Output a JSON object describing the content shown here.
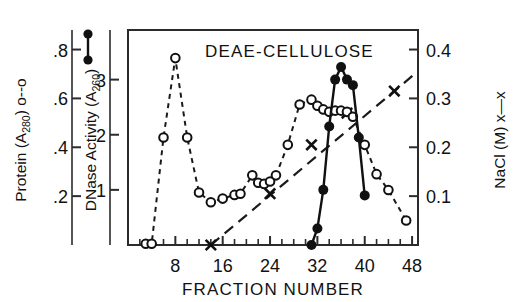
{
  "figure": {
    "title": "DEAE-CELLULOSE",
    "xaxis": {
      "label": "FRACTION NUMBER",
      "ticks": [
        "8",
        "16",
        "24",
        "32",
        "40",
        "48"
      ],
      "range": [
        0,
        49
      ]
    },
    "left_outer_axis": {
      "label_main": "Protein (A",
      "label_sub": "280",
      "label_tail": ") o--o",
      "ticks": [
        ".2",
        ".4",
        ".6",
        ".8"
      ],
      "range": [
        0,
        0.88
      ]
    },
    "left_inner_axis": {
      "label_main": "DNase Activity (A",
      "label_sub": "260",
      "label_tail": ")",
      "ticks": [
        "1",
        "2",
        "3"
      ],
      "range": [
        0,
        3.9
      ]
    },
    "right_axis": {
      "label_main": "NaCl (M) x—x",
      "ticks": [
        "0.1",
        "0.2",
        "0.3",
        "0.4"
      ],
      "range": [
        0,
        0.44
      ]
    },
    "legend": {
      "protein_symbol": "o--o",
      "dnase_symbol": "●—●",
      "nacl_symbol": "x—x"
    }
  },
  "chart_data": {
    "type": "line",
    "title": "DEAE-CELLULOSE",
    "xlabel": "FRACTION NUMBER",
    "ylabel": "Protein (A280) / DNase Activity (A260)",
    "y2label": "NaCl (M)",
    "xlim": [
      0,
      49
    ],
    "ylim": [
      0,
      0.88
    ],
    "y2lim": [
      0,
      0.44
    ],
    "grid": false,
    "legend_position": "left-axis-labels",
    "series": [
      {
        "name": "Protein (A280)",
        "marker": "open-circle",
        "linestyle": "dashed",
        "axis": "left-outer",
        "x": [
          3,
          4,
          6,
          8,
          10,
          12,
          14,
          16,
          18,
          19,
          21,
          22,
          23,
          24,
          25,
          27,
          29,
          31,
          32,
          33,
          34,
          35,
          36,
          37,
          38,
          40,
          42,
          44,
          47
        ],
        "y": [
          0.005,
          0.005,
          0.44,
          0.765,
          0.44,
          0.215,
          0.175,
          0.19,
          0.205,
          0.21,
          0.285,
          0.255,
          0.25,
          0.26,
          0.285,
          0.41,
          0.575,
          0.595,
          0.57,
          0.555,
          0.545,
          0.55,
          0.55,
          0.545,
          0.525,
          0.41,
          0.29,
          0.225,
          0.1
        ]
      },
      {
        "name": "DNase Activity (A260)",
        "marker": "filled-circle",
        "linestyle": "solid",
        "axis": "left-inner",
        "x": [
          31,
          32,
          33,
          34,
          35,
          36,
          37,
          38,
          39,
          40
        ],
        "y": [
          0.0,
          0.3,
          1.0,
          2.15,
          3.0,
          3.23,
          3.0,
          2.9,
          1.95,
          0.9
        ],
        "y_as_left_outer": [
          0.0,
          0.068,
          0.226,
          0.486,
          0.678,
          0.73,
          0.678,
          0.655,
          0.441,
          0.203
        ]
      },
      {
        "name": "NaCl (M)",
        "marker": "x",
        "linestyle": "long-dashed",
        "axis": "right",
        "x": [
          14,
          24,
          31,
          37,
          45
        ],
        "y": [
          0.0,
          0.105,
          0.205,
          0.27,
          0.315
        ]
      }
    ]
  }
}
